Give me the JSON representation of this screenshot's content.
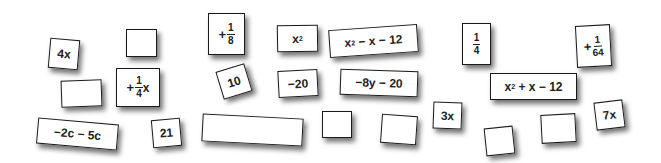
{
  "cards": [
    {
      "id": "4x",
      "text": "4x"
    },
    {
      "id": "blank-top-left",
      "text": ""
    },
    {
      "id": "blank-mid-left",
      "text": ""
    },
    {
      "id": "plus-quarter-x",
      "sign": "+",
      "num": "1",
      "den": "4",
      "suffix": "x"
    },
    {
      "id": "minus-2c-minus-5c",
      "text": "−2c − 5c"
    },
    {
      "id": "21",
      "text": "21"
    },
    {
      "id": "plus-eighth",
      "sign": "+",
      "num": "1",
      "den": "8"
    },
    {
      "id": "x-squared",
      "base": "x",
      "exp": "2"
    },
    {
      "id": "x2-minus-x-minus-12",
      "base": "x",
      "exp": "2",
      "rest": " − x − 12"
    },
    {
      "id": "10",
      "text": "10"
    },
    {
      "id": "minus-20",
      "text": "−20"
    },
    {
      "id": "minus-8y-minus-20",
      "text": "−8y − 20"
    },
    {
      "id": "blank-long",
      "text": ""
    },
    {
      "id": "blank-small-center",
      "text": ""
    },
    {
      "id": "blank-center-right",
      "text": ""
    },
    {
      "id": "quarter",
      "num": "1",
      "den": "4"
    },
    {
      "id": "x2-plus-x-minus-12",
      "base": "x",
      "exp": "2",
      "rest": " + x − 12"
    },
    {
      "id": "3x",
      "text": "3x"
    },
    {
      "id": "blank-bottom-right-1",
      "text": ""
    },
    {
      "id": "blank-bottom-right-2",
      "text": ""
    },
    {
      "id": "plus-1-64",
      "sign": "+",
      "num": "1",
      "den": "64"
    },
    {
      "id": "7x",
      "text": "7x"
    }
  ],
  "colors": {
    "card_border": "#1a1a1a",
    "card_fill": "#ffffff",
    "text": "#222222"
  }
}
